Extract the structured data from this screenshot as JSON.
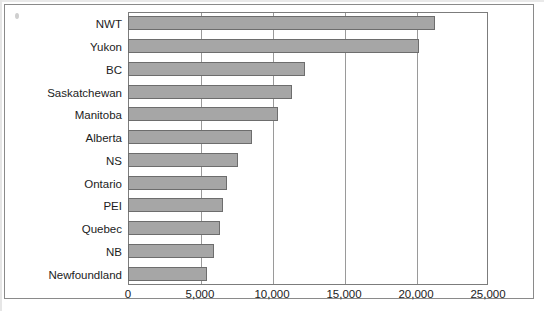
{
  "figure": {
    "background_color": "#ffffff",
    "frame_color": "#8a8a8a",
    "bar_fill_color": "#a6a6a6",
    "bar_border_color": "#6d6d6d",
    "gridline_color": "#9a9a9a"
  },
  "chart_data": {
    "type": "bar",
    "orientation": "horizontal",
    "title": "",
    "subtitle": "",
    "xlabel": "",
    "ylabel": "",
    "categories": [
      "NWT",
      "Yukon",
      "BC",
      "Saskatchewan",
      "Manitoba",
      "Alberta",
      "NS",
      "Ontario",
      "PEI",
      "Quebec",
      "NB",
      "Newfoundland"
    ],
    "values": [
      21300,
      20200,
      12300,
      11400,
      10400,
      8600,
      7650,
      6900,
      6600,
      6400,
      6000,
      5500
    ],
    "xlim": [
      0,
      25000
    ],
    "xticks": [
      0,
      5000,
      10000,
      15000,
      20000,
      25000
    ],
    "xtick_labels": [
      "0",
      "5,000",
      "10,000",
      "15,000",
      "20,000",
      "25,000"
    ],
    "grid": true,
    "grid_axis": "x",
    "legend": false,
    "legend_position": "none",
    "annotations": []
  }
}
